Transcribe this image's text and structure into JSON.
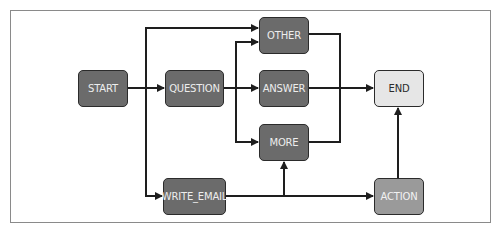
{
  "diagram": {
    "type": "flowchart",
    "nodes": {
      "start": {
        "label": "START",
        "style": "dark"
      },
      "question": {
        "label": "QUESTION",
        "style": "dark"
      },
      "other": {
        "label": "OTHER",
        "style": "dark"
      },
      "answer": {
        "label": "ANSWER",
        "style": "dark"
      },
      "more": {
        "label": "MORE",
        "style": "dark"
      },
      "end": {
        "label": "END",
        "style": "light"
      },
      "write_email": {
        "label": "WRITE_EMAIL",
        "style": "dark"
      },
      "action": {
        "label": "ACTION",
        "style": "mid"
      }
    },
    "edges": [
      {
        "from": "START",
        "to": "QUESTION"
      },
      {
        "from": "START",
        "to": "OTHER"
      },
      {
        "from": "START",
        "to": "WRITE_EMAIL"
      },
      {
        "from": "QUESTION",
        "to": "ANSWER"
      },
      {
        "from": "QUESTION",
        "to": "OTHER"
      },
      {
        "from": "QUESTION",
        "to": "MORE"
      },
      {
        "from": "OTHER",
        "to": "END"
      },
      {
        "from": "ANSWER",
        "to": "END"
      },
      {
        "from": "MORE",
        "to": "END"
      },
      {
        "from": "WRITE_EMAIL",
        "to": "MORE"
      },
      {
        "from": "WRITE_EMAIL",
        "to": "ACTION"
      },
      {
        "from": "ACTION",
        "to": "END"
      }
    ],
    "colors": {
      "dark_node": "#6b6b6b",
      "mid_node": "#9a9a9a",
      "light_node": "#e6e6e6",
      "edge": "#1e1e1e",
      "frame": "#8a8a8a"
    }
  }
}
